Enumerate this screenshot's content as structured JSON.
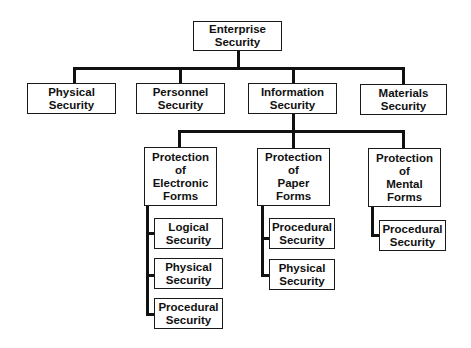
{
  "diagram": {
    "type": "org-chart",
    "root": {
      "label": "Enterprise\nSecurity"
    },
    "level1": [
      {
        "label": "Physical\nSecurity"
      },
      {
        "label": "Personnel\nSecurity"
      },
      {
        "label": "Information\nSecurity"
      },
      {
        "label": "Materials\nSecurity"
      }
    ],
    "level2": [
      {
        "label": "Protection\nof\nElectronic\nForms",
        "children": [
          {
            "label": "Logical\nSecurity"
          },
          {
            "label": "Physical\nSecurity"
          },
          {
            "label": "Procedural\nSecurity"
          }
        ]
      },
      {
        "label": "Protection\nof\nPaper\nForms",
        "children": [
          {
            "label": "Procedural\nSecurity"
          },
          {
            "label": "Physical\nSecurity"
          }
        ]
      },
      {
        "label": "Protection\nof\nMental\nForms",
        "children": [
          {
            "label": "Procedural\nSecurity"
          }
        ]
      }
    ],
    "edges": [
      [
        "Enterprise Security",
        "Physical Security"
      ],
      [
        "Enterprise Security",
        "Personnel Security"
      ],
      [
        "Enterprise Security",
        "Information Security"
      ],
      [
        "Enterprise Security",
        "Materials Security"
      ],
      [
        "Information Security",
        "Protection of Electronic Forms"
      ],
      [
        "Information Security",
        "Protection of Paper Forms"
      ],
      [
        "Information Security",
        "Protection of Mental Forms"
      ],
      [
        "Protection of Electronic Forms",
        "Logical Security"
      ],
      [
        "Protection of Electronic Forms",
        "Physical Security"
      ],
      [
        "Protection of Electronic Forms",
        "Procedural Security"
      ],
      [
        "Protection of Paper Forms",
        "Procedural Security"
      ],
      [
        "Protection of Paper Forms",
        "Physical Security"
      ],
      [
        "Protection of Mental Forms",
        "Procedural Security"
      ]
    ]
  }
}
